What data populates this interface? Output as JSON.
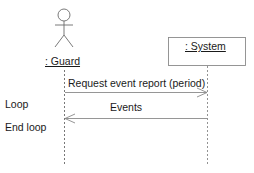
{
  "diagram": {
    "type": "sequence",
    "lifelines": [
      {
        "id": "guard",
        "kind": "actor",
        "label": ": Guard"
      },
      {
        "id": "system",
        "kind": "object",
        "label": ": System"
      }
    ],
    "messages": [
      {
        "from": "guard",
        "to": "system",
        "label": "Request event report (period)",
        "style": "solid-open-arrow"
      },
      {
        "from": "system",
        "to": "guard",
        "label": "Events",
        "style": "solid-open-arrow"
      }
    ],
    "annotations": [
      {
        "label": "Loop"
      },
      {
        "label": "End loop"
      }
    ]
  }
}
